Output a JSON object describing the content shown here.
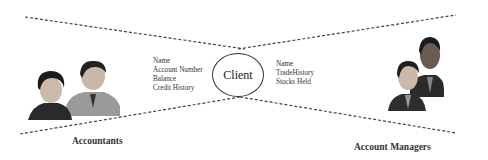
{
  "diagram": {
    "center": {
      "label": "Client"
    },
    "left_attributes": [
      "Name",
      "Account Number",
      "Balance",
      "Credit History"
    ],
    "right_attributes": [
      "Name",
      "TradeHistory",
      "Stocks Held"
    ],
    "left_group": {
      "label": "Accountants",
      "icon": "people-icon"
    },
    "right_group": {
      "label": "Account Managers",
      "icon": "people-icon"
    }
  },
  "colors": {
    "line": "#444444",
    "text": "#222222",
    "background": "#ffffff"
  }
}
